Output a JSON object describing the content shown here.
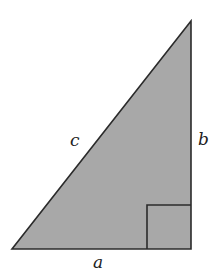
{
  "diagram": {
    "type": "right-triangle",
    "fill_color": "#a8a8a8",
    "stroke_color": "#2b2b2b",
    "vertices": {
      "top": [
        191,
        21
      ],
      "bottom_left": [
        12,
        249
      ],
      "bottom_right": [
        191,
        249
      ]
    },
    "right_angle_marker": {
      "x": 147,
      "y": 205,
      "size": 44
    },
    "labels": {
      "hypotenuse": "c",
      "vertical_leg": "b",
      "horizontal_leg": "a"
    }
  }
}
